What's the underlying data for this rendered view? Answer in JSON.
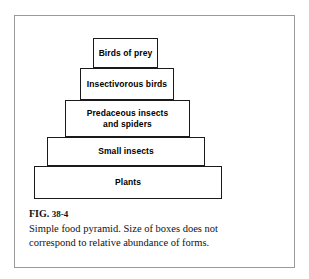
{
  "figure": {
    "frame_color": "#9a9a9a",
    "background": "#ffffff",
    "box_border_color": "#1a1a1a"
  },
  "pyramid": {
    "name": "food-pyramid",
    "tiers": [
      {
        "id": "birds-of-prey",
        "label": "Birds of prey"
      },
      {
        "id": "insectivorous-birds",
        "label": "Insectivorous birds"
      },
      {
        "id": "predaceous-insects",
        "label": "Predaceous insects\nand spiders"
      },
      {
        "id": "small-insects",
        "label": "Small insects"
      },
      {
        "id": "plants",
        "label": "Plants"
      }
    ]
  },
  "caption": {
    "figure_word": "FIG.",
    "figure_number": "38-4",
    "text": "Simple food pyramid. Size of boxes does not correspond to relative abundance of forms."
  }
}
